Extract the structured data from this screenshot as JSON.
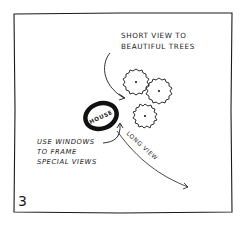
{
  "panel": {
    "number": "3"
  },
  "labels": {
    "short_view_line1": "SHORT VIEW TO",
    "short_view_line2": "BEAUTIFUL TREES",
    "house": "HOUSE",
    "windows_line1": "USE WINDOWS",
    "windows_line2": "TO FRAME",
    "windows_line3": "SPECIAL VIEWS",
    "long_view": "LONG VIEW"
  },
  "elements": {
    "trees_count": 3
  },
  "colors": {
    "ink": "#1a1a1a",
    "paper": "#ffffff"
  }
}
